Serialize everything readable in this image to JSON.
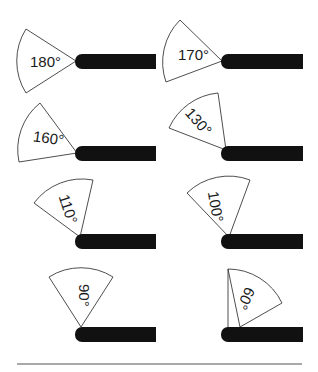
{
  "diagram": {
    "type": "joint-angle-illustrations",
    "items": [
      {
        "label": "180°",
        "position": "row1-left"
      },
      {
        "label": "170°",
        "position": "row1-right"
      },
      {
        "label": "160°",
        "position": "row2-left"
      },
      {
        "label": "130°",
        "position": "row2-right"
      },
      {
        "label": "110°",
        "position": "row3-left"
      },
      {
        "label": "100°",
        "position": "row3-right"
      },
      {
        "label": "90°",
        "position": "row4-left"
      },
      {
        "label": "60°",
        "position": "row4-right"
      }
    ],
    "colors": {
      "bar": "#111111",
      "sector_stroke": "#3a3a3a",
      "background": "#ffffff"
    }
  }
}
